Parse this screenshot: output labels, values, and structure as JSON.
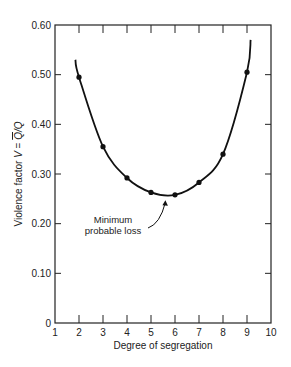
{
  "chart_data": {
    "type": "line",
    "title": "",
    "xlabel": "Degree of segregation",
    "ylabel": "Violence factor V = Q̄/Q",
    "xlim": [
      1,
      10
    ],
    "ylim": [
      0,
      0.6
    ],
    "x_ticks": [
      "1",
      "2",
      "3",
      "4",
      "5",
      "6",
      "7",
      "8",
      "9",
      "10"
    ],
    "y_ticks": [
      "0",
      "0.10",
      "0.20",
      "0.30",
      "0.40",
      "0.50",
      "0.60"
    ],
    "grid": false,
    "series": [
      {
        "name": "Violence factor",
        "x": [
          2,
          3,
          4,
          5,
          6,
          7,
          8,
          9
        ],
        "values": [
          0.495,
          0.355,
          0.292,
          0.263,
          0.258,
          0.283,
          0.34,
          0.505
        ],
        "markers": true,
        "curve_extent": {
          "x_start": 1.85,
          "y_start": 0.53,
          "x_end": 9.15,
          "y_end": 0.57
        }
      }
    ],
    "annotations": [
      {
        "text": "Minimum probable loss",
        "lines": [
          "Minimum",
          "probable loss"
        ],
        "points_to": {
          "x": 5.6,
          "y": 0.255
        }
      }
    ]
  }
}
